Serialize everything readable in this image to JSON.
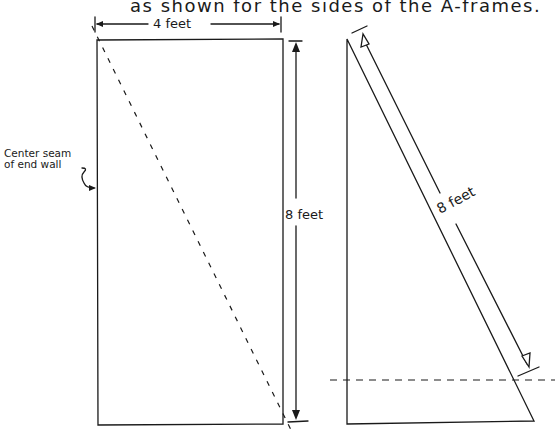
{
  "caption": "as shown for the sides of the A-frames.",
  "left_panel": {
    "width_label": "4 feet",
    "height_label": "8 feet",
    "seam_label_line1": "Center seam",
    "seam_label_line2": "of end wall"
  },
  "right_panel": {
    "diagonal_label": "8 feet"
  },
  "colors": {
    "ink": "#1a1a1a",
    "background": "#ffffff"
  }
}
